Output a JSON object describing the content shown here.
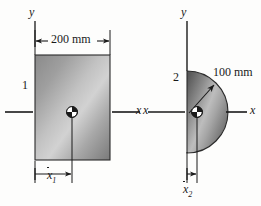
{
  "figure": {
    "background_color": "#fdfdfc",
    "ink_color": "#1a1a1a"
  },
  "shape1": {
    "part_number": "1",
    "type": "rectangle",
    "width_dimension": "200 mm",
    "centroid_dimension_x": "x",
    "centroid_dimension_sub": "1",
    "axis_y_label": "y",
    "axis_x_label": "x",
    "geometry": {
      "left": 35,
      "top": 55,
      "width": 75,
      "height": 105,
      "centroid_x": 72,
      "centroid_y": 112
    },
    "fill": {
      "light": "#c9c9c9",
      "dark": "#6e6e6e"
    }
  },
  "shape2": {
    "part_number": "2",
    "type": "semicircle",
    "radius_dimension": "100 mm",
    "centroid_dimension_x": "x",
    "centroid_dimension_sub": "2",
    "axis_y_label": "y",
    "axis_x_label_left": "x",
    "axis_x_label_right": "x",
    "geometry": {
      "flat_edge_x": 187,
      "center_y": 112,
      "radius": 41,
      "centroid_x": 197,
      "centroid_y": 112
    },
    "fill": {
      "light": "#cfcfcf",
      "dark": "#5f5f5f"
    }
  },
  "annotations": {
    "dim_200mm": "200 mm",
    "dim_100mm": "100 mm",
    "label_1": "1",
    "label_2": "2",
    "x_bar_1": "x",
    "x_bar_1_sub": "1",
    "x_bar_2": "x",
    "x_bar_2_sub": "2",
    "y_left": "y",
    "y_right": "y",
    "x_mid": "x",
    "x_right": "x"
  }
}
